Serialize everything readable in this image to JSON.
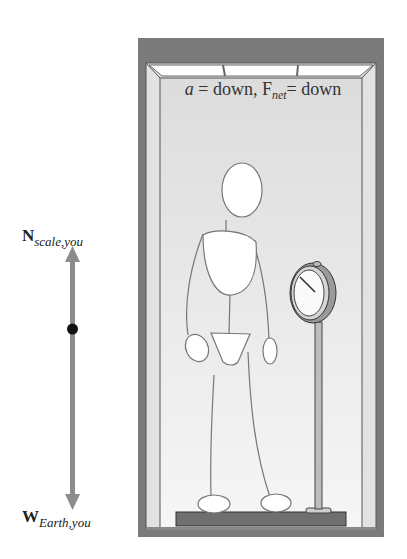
{
  "caption": {
    "accel_symbol": "a",
    "accel_text": " = down, ",
    "force_symbol": "F",
    "force_subscript": "net",
    "force_text": "= down"
  },
  "free_body_diagram": {
    "up_vector": {
      "symbol": "N",
      "subscript": "scale,you",
      "direction": "up"
    },
    "down_vector": {
      "symbol": "W",
      "subscript": "Earth,you",
      "direction": "down"
    },
    "object_marker": "point-mass-dot",
    "arrow_color": "#8c8c8c"
  },
  "scene": {
    "elevator_frame_color": "#7a7a7a",
    "wall_color": "#e6e6e6",
    "floor_color": "#707070",
    "scale_type": "dial scale on pole",
    "person": "stick figure standing on platform"
  }
}
